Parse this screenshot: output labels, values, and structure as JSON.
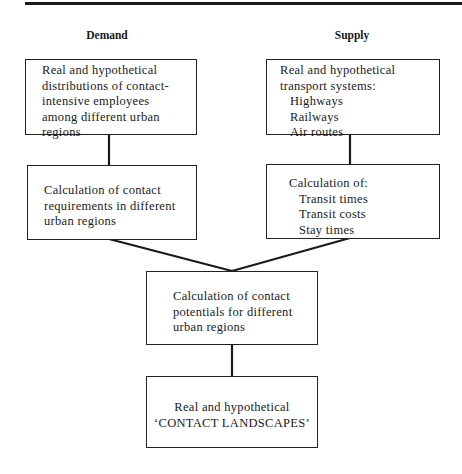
{
  "header": {
    "demand_label": "Demand",
    "supply_label": "Supply"
  },
  "demand": {
    "distribution_box": {
      "lines": [
        "Real and hypothetical",
        "distributions of contact-",
        "intensive employees",
        "among different urban",
        "regions"
      ]
    },
    "requirements_box": {
      "lines": [
        "Calculation of contact",
        "requirements in different",
        "urban regions"
      ]
    }
  },
  "supply": {
    "transport_box": {
      "heading_lines": [
        "Real and hypothetical",
        "transport systems:"
      ],
      "items": [
        "Highways",
        "Railways",
        "Air routes"
      ]
    },
    "calculation_box": {
      "heading": "Calculation of:",
      "items": [
        "Transit times",
        "Transit costs",
        "Stay times"
      ]
    }
  },
  "potentials_box": {
    "lines": [
      "Calculation of contact",
      "potentials for different",
      "urban regions"
    ]
  },
  "result_box": {
    "lines": [
      "Real and hypothetical",
      "‘CONTACT LANDSCAPES’"
    ]
  },
  "colors": {
    "ink": "#1a1a1a",
    "background": "#ffffff"
  }
}
